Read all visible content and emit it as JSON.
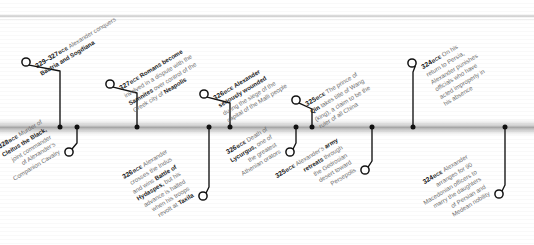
{
  "page": {
    "era_label": "BCE",
    "band_color": "#a8a8a8",
    "text_color": "#6d6d6d",
    "accent_color": "#1b1b1b"
  },
  "timeline": {
    "orientation": "horizontal",
    "axis_y_px": 127,
    "events": [
      {
        "id": "e1",
        "year": "329–327",
        "era": "BCE",
        "side": "above",
        "marker_x": 60,
        "circle_x": 26,
        "circle_y": 62,
        "lines": [
          {
            "text": "Alexander conquers",
            "bold": false
          },
          {
            "text": "Bactria and Sogdiana",
            "bold": true
          }
        ],
        "text": "329–327 BCE Alexander conquers Bactria and Sogdiana"
      },
      {
        "id": "e2",
        "year": "328",
        "era": "BCE",
        "side": "below",
        "marker_x": 77,
        "circle_x": 69,
        "circle_y": 152,
        "lines": [
          {
            "text": "Murder of",
            "bold": false
          },
          {
            "text": "Cleitus the Black,",
            "bold": true
          },
          {
            "text": "joint commander",
            "bold": false
          },
          {
            "text": "of Alexander’s",
            "bold": false
          },
          {
            "text": "Companion Cavalry",
            "bold": false
          }
        ],
        "text": "328 BCE Murder of Cleitus the Black, joint commander of Alexander’s Companion Cavalry"
      },
      {
        "id": "e3",
        "year": "327",
        "era": "BCE",
        "side": "above",
        "marker_x": 137,
        "circle_x": 110,
        "circle_y": 84,
        "lines": [
          {
            "text": "Romans become",
            "bold": true,
            "leadbold": true
          },
          {
            "text": "involved in a dispute with the",
            "bold": false
          },
          {
            "text": "Samnites over control of the",
            "bold": false,
            "mixed": "samnites"
          },
          {
            "text": "Greek city of Neapolis",
            "bold": false,
            "mixed": "neapolis"
          }
        ],
        "text": "327 BCE Romans become involved in a dispute with the Samnites over control of the Greek city of Neapolis"
      },
      {
        "id": "e4",
        "year": "326",
        "era": "BCE",
        "side": "below",
        "marker_x": 209,
        "circle_x": 203,
        "circle_y": 196,
        "lines": [
          {
            "text": "Alexander",
            "bold": false
          },
          {
            "text": "crosses the Indus",
            "bold": false
          },
          {
            "text": "and wins Battle of",
            "bold": false,
            "mixed": "battleof"
          },
          {
            "text": "Hydaspes, but his",
            "bold": false,
            "mixed": "hydaspes"
          },
          {
            "text": "advance is halted",
            "bold": false
          },
          {
            "text": "when his troops",
            "bold": false
          },
          {
            "text": "revolt at Taxila",
            "bold": false,
            "mixed": "taxila"
          }
        ],
        "text": "326 BCE Alexander crosses the Indus and wins Battle of Hydaspes, but his advance is halted when his troops revolt at Taxila"
      },
      {
        "id": "e5",
        "year": "326",
        "era": "BCE",
        "side": "above",
        "marker_x": 230,
        "circle_x": 204,
        "circle_y": 94,
        "lines": [
          {
            "text": "Alexander",
            "bold": true,
            "leadbold": true
          },
          {
            "text": "seriously wounded",
            "bold": true
          },
          {
            "text": "during the siege of the",
            "bold": false
          },
          {
            "text": "capital of the Malli people",
            "bold": false
          }
        ],
        "text": "326 BCE Alexander seriously wounded during the siege of the capital of the Malli people"
      },
      {
        "id": "e6",
        "year": "326",
        "era": "BCE",
        "side": "below",
        "marker_x": 296,
        "circle_x": 290,
        "circle_y": 152,
        "lines": [
          {
            "text": "Death of",
            "bold": false
          },
          {
            "text": "Lycurgus, one of",
            "bold": false,
            "mixed": "lycurgus"
          },
          {
            "text": "the greatest",
            "bold": false
          },
          {
            "text": "Athenian orators",
            "bold": false
          }
        ],
        "text": "326 BCE Death of Lycurgus, one of the greatest Athenian orators"
      },
      {
        "id": "e7",
        "year": "325",
        "era": "BCE",
        "side": "above",
        "marker_x": 312,
        "circle_x": 296,
        "circle_y": 100,
        "lines": [
          {
            "text": "The prince of",
            "bold": false
          },
          {
            "text": "Qin takes title of Wang",
            "bold": false,
            "mixed": "qin"
          },
          {
            "text": "(king), a claim to be the",
            "bold": false
          },
          {
            "text": "ruler of all China",
            "bold": false
          }
        ],
        "text": "325 BCE The prince of Qin takes title of Wang (king), a claim to be the ruler of all China"
      },
      {
        "id": "e8",
        "year": "325",
        "era": "BCE",
        "side": "below",
        "marker_x": 372,
        "circle_x": 365,
        "circle_y": 170,
        "lines": [
          {
            "text": "Alexander’s army",
            "bold": false,
            "mixed": "army"
          },
          {
            "text": "retreats through",
            "bold": false,
            "mixed": "retreats"
          },
          {
            "text": "the Gedrosian",
            "bold": false
          },
          {
            "text": "desert toward",
            "bold": false
          },
          {
            "text": "Persepolis",
            "bold": false
          }
        ],
        "text": "325 BCE Alexander’s army retreats through the Gedrosian desert toward Persepolis"
      },
      {
        "id": "e9",
        "year": "324",
        "era": "BCE",
        "side": "above",
        "marker_x": 413,
        "circle_x": 412,
        "circle_y": 63,
        "lines": [
          {
            "text": "On his",
            "bold": false
          },
          {
            "text": "return to Persia,",
            "bold": false
          },
          {
            "text": "Alexander punishes",
            "bold": false
          },
          {
            "text": "officials who have",
            "bold": false
          },
          {
            "text": "acted improperly in",
            "bold": false
          },
          {
            "text": "his absence",
            "bold": false
          }
        ],
        "text": "324 BCE On his return to Persia, Alexander punishes officials who have acted improperly in his absence"
      },
      {
        "id": "e10",
        "year": "324",
        "era": "BCE",
        "side": "below",
        "marker_x": 505,
        "circle_x": 499,
        "circle_y": 194,
        "lines": [
          {
            "text": "Alexander",
            "bold": false
          },
          {
            "text": "arranges for 90",
            "bold": false
          },
          {
            "text": "Macedonian officers to",
            "bold": false
          },
          {
            "text": "marry the daughters",
            "bold": false
          },
          {
            "text": "of Persian and",
            "bold": false
          },
          {
            "text": "Medean nobility",
            "bold": false
          }
        ],
        "text": "324 BCE Alexander arranges for 90 Macedonian officers to marry the daughters of Persian and Medean nobility"
      }
    ]
  }
}
